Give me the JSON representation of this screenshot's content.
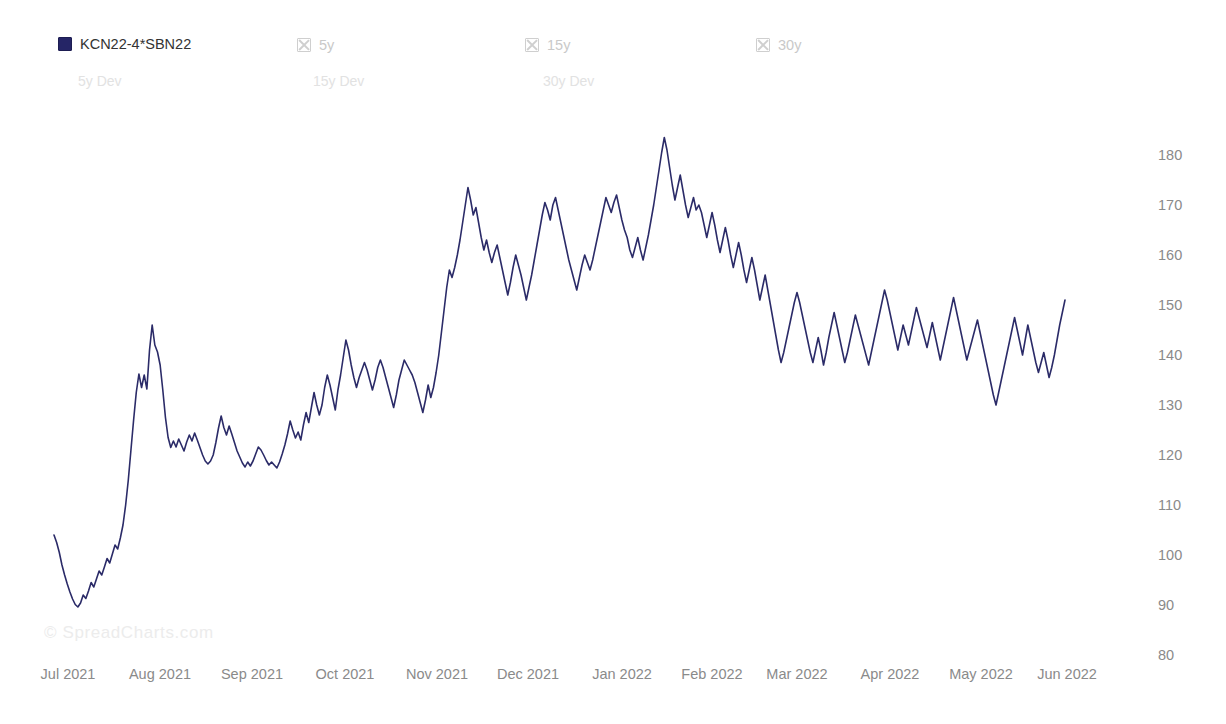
{
  "legend": {
    "items": [
      {
        "label": "KCN22-4*SBN22",
        "state": "active",
        "icon": "filled-square-icon"
      },
      {
        "label": "5y",
        "state": "disabled",
        "icon": "crossed-box-icon"
      },
      {
        "label": "15y",
        "state": "disabled",
        "icon": "crossed-box-icon"
      },
      {
        "label": "30y",
        "state": "disabled",
        "icon": "crossed-box-icon"
      }
    ],
    "dev_items": [
      {
        "label": "5y Dev"
      },
      {
        "label": "15y Dev"
      },
      {
        "label": "30y Dev"
      }
    ]
  },
  "watermark": {
    "text": "© SpreadCharts.com"
  },
  "colors": {
    "series": "#2b2b68",
    "axis_text": "#8a8a8a",
    "legend_active_text": "#333333",
    "legend_disabled_text": "#c9c9c9",
    "dev_text": "#e2e2e2",
    "background": "#ffffff"
  },
  "chart_data": {
    "type": "line",
    "title": "",
    "xlabel": "",
    "ylabel": "",
    "grid": false,
    "legend_position": "top",
    "y_axis_position": "right",
    "ylim": [
      80,
      185
    ],
    "yticks": [
      180,
      170,
      160,
      150,
      140,
      130,
      120,
      110,
      100,
      90,
      80
    ],
    "xticks": [
      "Jul 2021",
      "Aug 2021",
      "Sep 2021",
      "Oct 2021",
      "Nov 2021",
      "Dec 2021",
      "Jan 2022",
      "Feb 2022",
      "Mar 2022",
      "Apr 2022",
      "May 2022",
      "Jun 2022"
    ],
    "xtick_positions": [
      68,
      160,
      252,
      345,
      437,
      528,
      622,
      712,
      797,
      890,
      981,
      1067
    ],
    "series": [
      {
        "name": "KCN22-4*SBN22",
        "color": "#2b2b68",
        "x_start": 54,
        "x_end": 1065,
        "values": [
          104.0,
          102.5,
          100.5,
          98.0,
          96.0,
          94.2,
          92.6,
          91.2,
          90.1,
          89.6,
          90.4,
          92.0,
          91.3,
          92.8,
          94.5,
          93.6,
          95.2,
          96.8,
          96.0,
          97.6,
          99.3,
          98.4,
          100.2,
          102.0,
          101.2,
          103.4,
          106.0,
          110.0,
          115.0,
          121.0,
          127.0,
          132.5,
          136.2,
          133.5,
          136.0,
          133.2,
          141.0,
          146.0,
          142.0,
          140.6,
          138.0,
          133.0,
          127.5,
          123.5,
          121.5,
          122.8,
          121.6,
          123.2,
          122.0,
          120.8,
          122.6,
          124.0,
          122.8,
          124.4,
          123.0,
          121.5,
          120.0,
          118.8,
          118.2,
          118.8,
          120.0,
          122.5,
          125.4,
          127.8,
          125.5,
          124.0,
          125.8,
          124.2,
          122.5,
          120.8,
          119.6,
          118.4,
          117.6,
          118.6,
          117.8,
          118.8,
          120.2,
          121.6,
          121.0,
          120.0,
          118.9,
          118.0,
          118.6,
          118.0,
          117.4,
          118.6,
          120.2,
          122.0,
          124.2,
          126.8,
          125.0,
          123.4,
          124.6,
          123.0,
          126.0,
          128.5,
          126.5,
          129.5,
          132.5,
          130.0,
          128.0,
          130.0,
          133.5,
          136.0,
          134.0,
          131.5,
          129.0,
          133.0,
          136.0,
          139.5,
          143.0,
          141.0,
          138.0,
          135.5,
          133.5,
          135.5,
          137.0,
          138.5,
          137.0,
          135.0,
          133.0,
          135.0,
          137.5,
          139.0,
          137.5,
          135.5,
          133.5,
          131.5,
          129.5,
          132.0,
          135.0,
          137.0,
          139.0,
          138.0,
          137.0,
          136.0,
          134.5,
          132.5,
          130.5,
          128.5,
          131.0,
          134.0,
          131.5,
          133.5,
          136.5,
          140.0,
          144.5,
          149.0,
          153.5,
          157.0,
          155.5,
          157.5,
          160.0,
          163.0,
          166.5,
          170.0,
          173.5,
          171.0,
          168.0,
          169.5,
          166.5,
          163.5,
          161.0,
          163.0,
          160.5,
          158.5,
          160.5,
          162.0,
          159.5,
          157.0,
          154.5,
          152.0,
          154.5,
          157.5,
          160.0,
          158.0,
          156.0,
          153.5,
          151.0,
          153.5,
          156.0,
          159.0,
          162.0,
          165.0,
          168.0,
          170.5,
          169.0,
          167.0,
          170.0,
          171.5,
          169.0,
          166.5,
          164.0,
          161.5,
          159.0,
          157.0,
          155.0,
          153.0,
          155.5,
          158.0,
          160.0,
          158.5,
          157.0,
          159.0,
          161.5,
          164.0,
          166.5,
          169.0,
          171.5,
          170.0,
          168.5,
          170.5,
          172.0,
          169.5,
          167.0,
          165.0,
          163.5,
          161.0,
          159.5,
          161.5,
          163.5,
          161.0,
          159.0,
          161.5,
          164.0,
          167.0,
          170.0,
          173.5,
          177.0,
          180.5,
          183.5,
          181.0,
          177.5,
          174.0,
          171.0,
          173.5,
          176.0,
          173.0,
          170.0,
          167.5,
          169.5,
          171.5,
          169.0,
          170.0,
          168.5,
          166.0,
          163.5,
          166.0,
          168.5,
          166.0,
          163.0,
          160.5,
          163.0,
          165.5,
          163.0,
          160.0,
          157.5,
          160.0,
          162.5,
          160.0,
          157.0,
          154.5,
          157.0,
          159.5,
          157.0,
          154.0,
          151.0,
          153.5,
          156.0,
          153.0,
          150.0,
          147.0,
          144.0,
          141.0,
          138.5,
          140.5,
          143.0,
          145.5,
          148.0,
          150.5,
          152.5,
          150.5,
          148.0,
          145.5,
          143.0,
          140.5,
          138.5,
          141.0,
          143.5,
          141.0,
          138.0,
          140.5,
          143.5,
          146.0,
          148.5,
          146.0,
          143.5,
          141.0,
          138.5,
          140.5,
          143.0,
          145.5,
          148.0,
          146.0,
          144.0,
          142.0,
          140.0,
          138.0,
          140.5,
          143.0,
          145.5,
          148.0,
          150.5,
          153.0,
          151.0,
          148.5,
          146.0,
          143.5,
          141.0,
          143.5,
          146.0,
          144.0,
          142.0,
          144.5,
          147.0,
          149.5,
          147.5,
          145.5,
          143.5,
          141.5,
          144.0,
          146.5,
          144.0,
          141.5,
          139.0,
          141.5,
          144.0,
          146.5,
          149.0,
          151.5,
          149.0,
          146.5,
          144.0,
          141.5,
          139.0,
          141.0,
          143.0,
          145.0,
          147.0,
          144.5,
          142.0,
          139.5,
          137.0,
          134.5,
          132.0,
          130.0,
          132.5,
          135.0,
          137.5,
          140.0,
          142.5,
          145.0,
          147.5,
          145.0,
          142.5,
          140.0,
          143.0,
          146.0,
          143.5,
          141.0,
          138.5,
          136.5,
          138.5,
          140.5,
          138.0,
          135.5,
          137.5,
          140.0,
          143.0,
          146.0,
          148.5,
          151.0
        ]
      }
    ]
  }
}
